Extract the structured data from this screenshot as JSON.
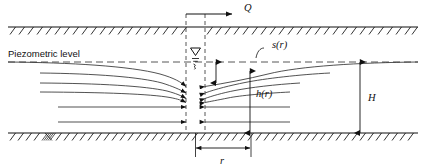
{
  "figure": {
    "kind": "well-pumping-confined-aquifer-cross-section",
    "background_color": "#ffffff",
    "line_color": "#111111",
    "flow_line_color": "#333333",
    "dashed_color": "#444444"
  },
  "labels": {
    "discharge": "Q",
    "piezometric_level": "Piezometric level",
    "drawdown": "s(r)",
    "head": "h(r)",
    "aquifer_thickness": "H",
    "radius": "r"
  },
  "icons": {
    "water_table_symbol": "water-table-triangle-icon",
    "discharge_arrow": "discharge-arrow-icon",
    "hatching_top": "confining-layer-hatch-icon",
    "hatching_bottom": "bedrock-hatch-icon"
  },
  "geometry": {
    "top_boundary_y": 27,
    "bottom_boundary_y": 133,
    "piezometric_y": 62,
    "well_left_x": 186,
    "well_right_x": 205,
    "well_center_x": 195.5,
    "well_top_y": 14,
    "diagram_left_x": 8,
    "diagram_right_x": 418,
    "h_dimension_x": 360,
    "r_dimension_left_x": 195.5,
    "r_dimension_right_x": 251,
    "r_dimension_y": 148
  },
  "flow_lines_left": [
    {
      "start_x": 8,
      "start_y": 62,
      "label": "piezometric-surface-left"
    },
    {
      "start_x": 40,
      "start_y": 73
    },
    {
      "start_x": 40,
      "start_y": 83
    },
    {
      "start_x": 40,
      "start_y": 92
    },
    {
      "start_x": 58,
      "start_y": 107
    },
    {
      "start_x": 58,
      "start_y": 122
    }
  ],
  "flow_lines_right": [
    {
      "start_x": 418,
      "start_y": 62
    },
    {
      "start_x": 330,
      "start_y": 73
    },
    {
      "start_x": 300,
      "start_y": 83
    },
    {
      "start_x": 290,
      "start_y": 92
    },
    {
      "start_x": 290,
      "start_y": 107
    },
    {
      "start_x": 290,
      "start_y": 122
    }
  ]
}
